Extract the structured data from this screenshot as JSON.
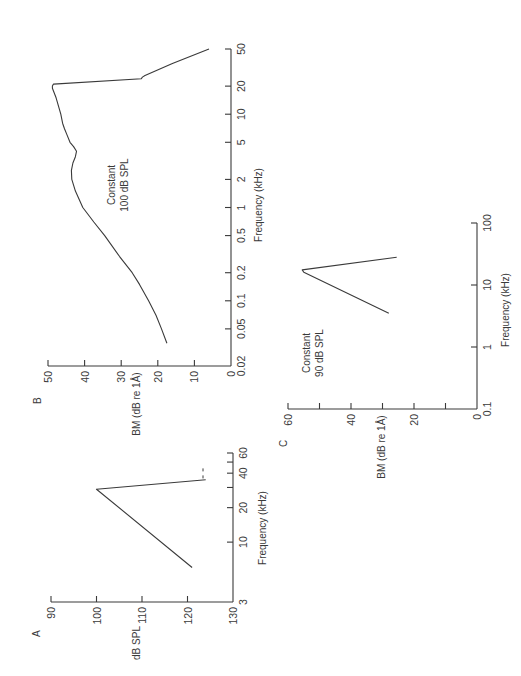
{
  "figure": {
    "rotation_note": "Page is rotated 90 degrees counter-clockwise; frequency axes run bottom-to-top, value axes right-to-left",
    "ink_color": "#3a3a3a",
    "background": "#ffffff"
  },
  "chart_data": [
    {
      "panel": "A",
      "type": "line",
      "title": "",
      "xlabel": "Frequency (kHz)",
      "ylabel": "dB SPL",
      "xscale": "log",
      "xlim": [
        3,
        60
      ],
      "ylim": [
        130,
        90
      ],
      "y_inverted": true,
      "xticks": [
        3,
        10,
        20,
        30,
        40,
        50,
        60
      ],
      "xtick_labels": [
        "3",
        "10",
        "20",
        "",
        "40",
        "",
        "60"
      ],
      "yticks": [
        90,
        100,
        110,
        120,
        130
      ],
      "ytick_labels": [
        "90",
        "100",
        "110",
        "120",
        "130"
      ],
      "series": [
        {
          "name": "threshold",
          "style": "solid",
          "x": [
            6,
            29,
            35
          ],
          "y": [
            121,
            100,
            124
          ]
        },
        {
          "name": "extension",
          "style": "dashed",
          "x": [
            36,
            46
          ],
          "y": [
            123.4,
            123.4
          ]
        }
      ],
      "grid": false,
      "annotation": ""
    },
    {
      "panel": "B",
      "type": "line",
      "title": "",
      "xlabel": "Frequency (kHz)",
      "ylabel": "BM (dB re 1Å)",
      "xscale": "log",
      "xlim": [
        0.02,
        50
      ],
      "ylim": [
        0,
        50
      ],
      "xticks": [
        0.02,
        0.05,
        0.1,
        0.2,
        0.5,
        1,
        2,
        5,
        10,
        20,
        50
      ],
      "xtick_labels": [
        "0.02",
        "0.05",
        "0.1",
        "0.2",
        "0.5",
        "1",
        "2",
        "5",
        "10",
        "20",
        "50"
      ],
      "yticks": [
        0,
        10,
        20,
        30,
        40,
        50
      ],
      "ytick_labels": [
        "0",
        "10",
        "20",
        "30",
        "40",
        "50"
      ],
      "series": [
        {
          "name": "BM response",
          "style": "solid",
          "x": [
            0.035,
            0.05,
            0.07,
            0.1,
            0.15,
            0.2,
            0.3,
            0.5,
            0.7,
            1,
            1.5,
            2,
            2.5,
            3,
            3.5,
            4,
            4.5,
            5,
            6,
            7,
            8,
            10,
            15,
            19,
            20,
            21,
            24,
            25,
            26,
            35,
            50
          ],
          "y": [
            17.5,
            19,
            20.5,
            22.5,
            25,
            27,
            30.5,
            34.5,
            37.5,
            40.5,
            42.5,
            43.5,
            43.6,
            43.2,
            42.5,
            42.2,
            43,
            44,
            44.8,
            45.5,
            46,
            46.5,
            47.8,
            48.8,
            48.8,
            48.5,
            24.5,
            24.2,
            23.5,
            16,
            6
          ]
        }
      ],
      "grid": false,
      "annotation": "Constant 100 dB SPL"
    },
    {
      "panel": "C",
      "type": "line",
      "title": "",
      "xlabel": "Frequency (kHz)",
      "ylabel": "BM (dB re 1Å)",
      "xscale": "log",
      "xlim": [
        0.1,
        100
      ],
      "ylim": [
        0,
        60
      ],
      "xticks": [
        0.1,
        1,
        10,
        100
      ],
      "xtick_labels": [
        "0.1",
        "1",
        "10",
        "100"
      ],
      "yticks": [
        0,
        10,
        20,
        30,
        40,
        50,
        60
      ],
      "ytick_labels": [
        "0",
        "",
        "20",
        "",
        "40",
        "",
        "60"
      ],
      "series": [
        {
          "name": "BM response",
          "style": "solid",
          "x": [
            3.5,
            16,
            17.5,
            28
          ],
          "y": [
            28,
            55,
            55.5,
            25.5
          ]
        }
      ],
      "grid": false,
      "annotation": "Constant 90 dB SPL"
    }
  ],
  "panels": {
    "A": {
      "letter": "A",
      "ylabel": "dB SPL",
      "xlabel": "Frequency   (kHz)",
      "origin": [
        233,
        602
      ],
      "value_px_per_unit": -4.55,
      "value_min": 130,
      "freq_min": 3,
      "freq_max": 60,
      "freq_px_len": 149
    },
    "B": {
      "letter": "B",
      "ylabel": "BM  (dB  re  1Å)",
      "xlabel": "Frequency  (kHz)",
      "annotation_line1": "Constant",
      "annotation_line2": "100 dB  SPL",
      "origin": [
        231,
        366
      ],
      "value_px_per_unit": 3.66,
      "value_min": 0,
      "freq_min": 0.02,
      "freq_max": 50,
      "freq_px_len": 317
    },
    "C": {
      "letter": "C",
      "ylabel": "BM  (dB  re  1Å)",
      "xlabel": "Frequency  (kHz)",
      "annotation_line1": "Constant",
      "annotation_line2": "90  dB  SPL",
      "origin": [
        477,
        409
      ],
      "value_px_per_unit": 3.15,
      "value_min": 0,
      "freq_min": 0.1,
      "freq_max": 100,
      "freq_px_len": 186
    }
  }
}
